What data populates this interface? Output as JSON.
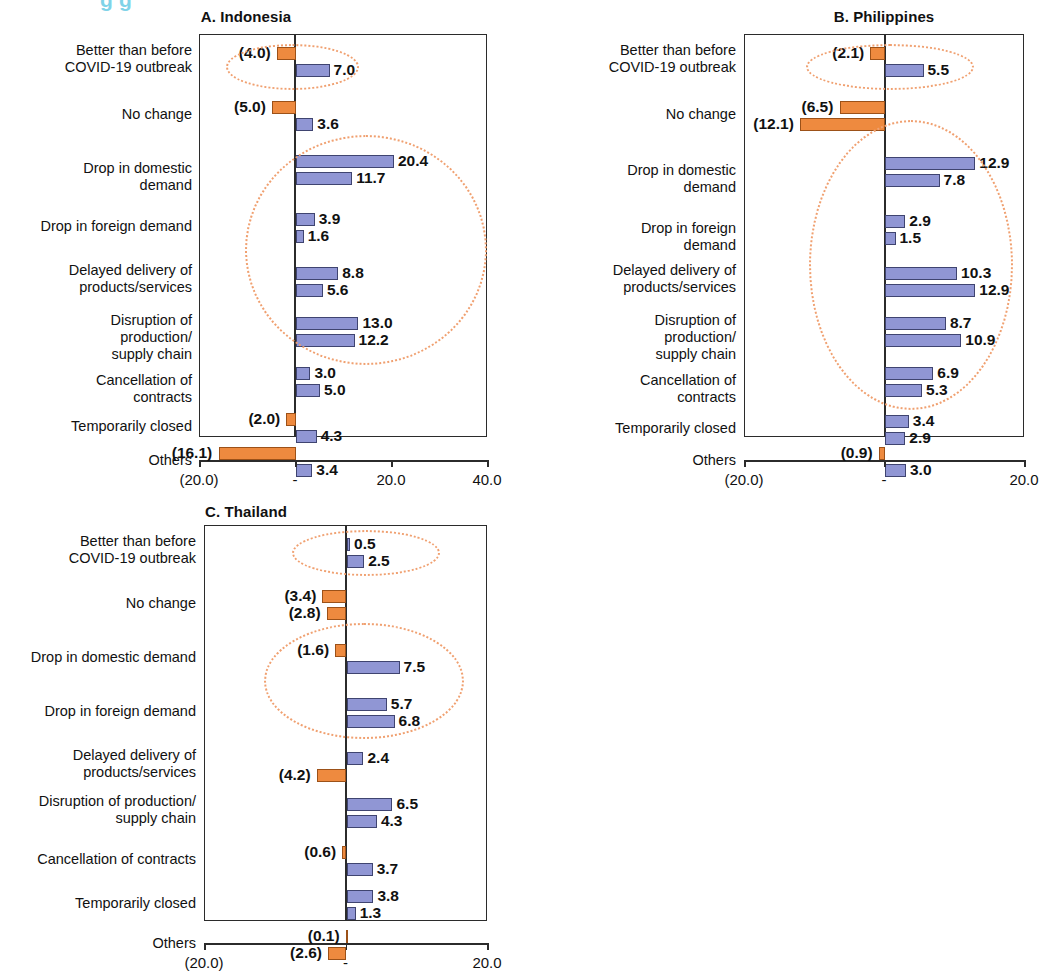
{
  "cut_title": "g                              g",
  "panels": [
    {
      "id": "indonesia",
      "title": "A. Indonesia",
      "axis": {
        "ticks": [
          "(20.0)",
          "-",
          "20.0",
          "40.0"
        ],
        "min": -20,
        "max": 40
      },
      "categories": [
        "Better than before\nCOVID-19 outbreak",
        "No change",
        "Drop in domestic demand",
        "Drop in foreign demand",
        "Delayed delivery of\nproducts/services",
        "Disruption of production/\nsupply chain",
        "Cancellation of contracts",
        "Temporarily closed",
        "Others"
      ],
      "series": [
        {
          "name": "upper",
          "values": [
            -4.0,
            -5.0,
            20.4,
            3.9,
            8.8,
            13.0,
            3.0,
            -2.0,
            -16.1
          ],
          "labels": [
            "(4.0)",
            "(5.0)",
            "20.4",
            "3.9",
            "8.8",
            "13.0",
            "3.0",
            "(2.0)",
            "(16.1)"
          ]
        },
        {
          "name": "lower",
          "values": [
            7.0,
            3.6,
            11.7,
            1.6,
            5.6,
            12.2,
            5.0,
            4.3,
            3.4
          ],
          "labels": [
            "7.0",
            "3.6",
            "11.7",
            "1.6",
            "5.6",
            "12.2",
            "5.0",
            "4.3",
            "3.4"
          ]
        }
      ]
    },
    {
      "id": "philippines",
      "title": "B. Philippines",
      "axis": {
        "ticks": [
          "(20.0)",
          "-",
          "20.0"
        ],
        "min": -20,
        "max": 20
      },
      "categories": [
        "Better than before\nCOVID-19 outbreak",
        "No change",
        "Drop in domestic demand",
        "Drop in foreign demand",
        "Delayed delivery of\nproducts/services",
        "Disruption of production/\nsupply chain",
        "Cancellation of contracts",
        "Temporarily closed",
        "Others"
      ],
      "series": [
        {
          "name": "upper",
          "values": [
            -2.1,
            -6.5,
            12.9,
            2.9,
            10.3,
            8.7,
            6.9,
            3.4,
            -0.9
          ],
          "labels": [
            "(2.1)",
            "(6.5)",
            "12.9",
            "2.9",
            "10.3",
            "8.7",
            "6.9",
            "3.4",
            "(0.9)"
          ]
        },
        {
          "name": "lower",
          "values": [
            5.5,
            -12.1,
            7.8,
            1.5,
            12.9,
            10.9,
            5.3,
            2.9,
            3.0
          ],
          "labels": [
            "5.5",
            "(12.1)",
            "7.8",
            "1.5",
            "12.9",
            "10.9",
            "5.3",
            "2.9",
            "3.0"
          ]
        }
      ]
    },
    {
      "id": "thailand",
      "title": "C. Thailand",
      "axis": {
        "ticks": [
          "(20.0)",
          "-",
          "20.0"
        ],
        "min": -20,
        "max": 20
      },
      "categories": [
        "Better than before\nCOVID-19 outbreak",
        "No change",
        "Drop in domestic demand",
        "Drop in foreign demand",
        "Delayed delivery of\nproducts/services",
        "Disruption of production/\nsupply chain",
        "Cancellation of contracts",
        "Temporarily closed",
        "Others"
      ],
      "series": [
        {
          "name": "upper",
          "values": [
            0.5,
            -3.4,
            -1.6,
            5.7,
            2.4,
            6.5,
            -0.6,
            3.8,
            -0.1
          ],
          "labels": [
            "0.5",
            "(3.4)",
            "(1.6)",
            "5.7",
            "2.4",
            "6.5",
            "(0.6)",
            "3.8",
            "(0.1)"
          ]
        },
        {
          "name": "lower",
          "values": [
            2.5,
            -2.8,
            7.5,
            6.8,
            -4.2,
            4.3,
            3.7,
            1.3,
            -2.6
          ],
          "labels": [
            "2.5",
            "(2.8)",
            "7.5",
            "6.8",
            "(4.2)",
            "4.3",
            "3.7",
            "1.3",
            "(2.6)"
          ]
        }
      ]
    }
  ],
  "chart_data": {
    "type": "bar",
    "orientation": "horizontal",
    "grid": false,
    "legend": "none",
    "colors": {
      "positive_bar": "#9096d4",
      "negative_bar": "#ee8a3f",
      "annotation_ellipse": "#f0a070"
    },
    "note": "Each category has two stacked sub-bars (upper and lower). Negative values shown in parentheses.",
    "panels": [
      {
        "panel": "A. Indonesia",
        "xlabel": "",
        "ylabel": "",
        "xlim": [
          -20,
          40
        ],
        "xticks": [
          -20,
          0,
          20,
          40
        ],
        "xticklabels": [
          "(20.0)",
          "-",
          "20.0",
          "40.0"
        ],
        "categories": [
          "Better than before COVID-19 outbreak",
          "No change",
          "Drop in domestic demand",
          "Drop in foreign demand",
          "Delayed delivery of products/services",
          "Disruption of production/supply chain",
          "Cancellation of contracts",
          "Temporarily closed",
          "Others"
        ],
        "series": [
          {
            "name": "upper",
            "values": [
              -4.0,
              -5.0,
              20.4,
              3.9,
              8.8,
              13.0,
              3.0,
              -2.0,
              -16.1
            ]
          },
          {
            "name": "lower",
            "values": [
              7.0,
              3.6,
              11.7,
              1.6,
              5.6,
              12.2,
              5.0,
              4.3,
              3.4
            ]
          }
        ],
        "annotations": [
          {
            "type": "ellipse",
            "covers": [
              "Better than before COVID-19 outbreak"
            ]
          },
          {
            "type": "ellipse",
            "covers": [
              "Drop in domestic demand",
              "Drop in foreign demand",
              "Delayed delivery of products/services",
              "Disruption of production/supply chain",
              "Cancellation of contracts"
            ]
          }
        ]
      },
      {
        "panel": "B. Philippines",
        "xlabel": "",
        "ylabel": "",
        "xlim": [
          -20,
          20
        ],
        "xticks": [
          -20,
          0,
          20
        ],
        "xticklabels": [
          "(20.0)",
          "-",
          "20.0"
        ],
        "categories": [
          "Better than before COVID-19 outbreak",
          "No change",
          "Drop in domestic demand",
          "Drop in foreign demand",
          "Delayed delivery of products/services",
          "Disruption of production/supply chain",
          "Cancellation of contracts",
          "Temporarily closed",
          "Others"
        ],
        "series": [
          {
            "name": "upper",
            "values": [
              -2.1,
              -6.5,
              12.9,
              2.9,
              10.3,
              8.7,
              6.9,
              3.4,
              -0.9
            ]
          },
          {
            "name": "lower",
            "values": [
              5.5,
              -12.1,
              7.8,
              1.5,
              12.9,
              10.9,
              5.3,
              2.9,
              3.0
            ]
          }
        ],
        "annotations": [
          {
            "type": "ellipse",
            "covers": [
              "Better than before COVID-19 outbreak"
            ]
          },
          {
            "type": "ellipse",
            "covers": [
              "Drop in domestic demand",
              "Drop in foreign demand",
              "Delayed delivery of products/services",
              "Disruption of production/supply chain",
              "Cancellation of contracts",
              "Temporarily closed"
            ]
          }
        ]
      },
      {
        "panel": "C. Thailand",
        "xlabel": "",
        "ylabel": "",
        "xlim": [
          -20,
          20
        ],
        "xticks": [
          -20,
          0,
          20
        ],
        "xticklabels": [
          "(20.0)",
          "-",
          "20.0"
        ],
        "categories": [
          "Better than before COVID-19 outbreak",
          "No change",
          "Drop in domestic demand",
          "Drop in foreign demand",
          "Delayed delivery of products/services",
          "Disruption of production/supply chain",
          "Cancellation of contracts",
          "Temporarily closed",
          "Others"
        ],
        "series": [
          {
            "name": "upper",
            "values": [
              0.5,
              -3.4,
              -1.6,
              5.7,
              2.4,
              6.5,
              -0.6,
              3.8,
              -0.1
            ]
          },
          {
            "name": "lower",
            "values": [
              2.5,
              -2.8,
              7.5,
              6.8,
              -4.2,
              4.3,
              3.7,
              1.3,
              -2.6
            ]
          }
        ],
        "annotations": [
          {
            "type": "ellipse",
            "covers": [
              "Better than before COVID-19 outbreak"
            ]
          },
          {
            "type": "ellipse",
            "covers": [
              "Drop in domestic demand",
              "Drop in foreign demand"
            ]
          }
        ]
      }
    ]
  }
}
